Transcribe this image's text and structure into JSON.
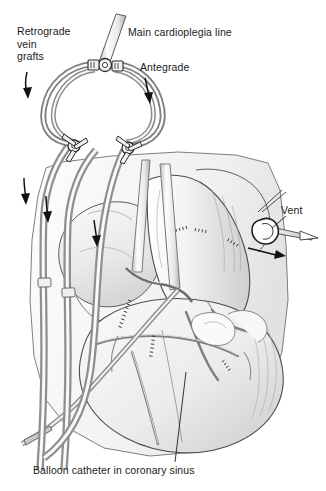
{
  "figure": {
    "labels": {
      "retrograde_vein_grafts": "Retrograde\nvein\ngrafts",
      "main_cardioplegia_line": "Main cardioplegia line",
      "antegrade": "Antegrade",
      "vent": "Vent",
      "balloon_catheter": "Balloon catheter in coronary sinus"
    },
    "colors": {
      "ink": "#1a1a1a",
      "line": "#3c3c3c",
      "tube_stroke": "#8a8a8a",
      "tube_fill": "#f2f2f2",
      "tissue_light": "#f7f7f7",
      "tissue_mid": "#e3e3e3",
      "tissue_dark": "#c9c9c9",
      "background": "#ffffff"
    },
    "flow_arrows": [
      {
        "name": "retrograde-flow-arrow",
        "direction": "down"
      },
      {
        "name": "antegrade-flow-arrow",
        "direction": "down"
      },
      {
        "name": "left-tube-flow-arrow",
        "direction": "down"
      },
      {
        "name": "mid-tube-flow-arrow",
        "direction": "down"
      },
      {
        "name": "right-tube-flow-arrow",
        "direction": "down"
      },
      {
        "name": "vent-flow-arrow",
        "direction": "right"
      }
    ],
    "components": [
      "main-cardioplegia-line",
      "y-connector-top",
      "antegrade-limb",
      "retrograde-limb",
      "stopcock-left",
      "stopcock-right",
      "aortic-root-cannula",
      "vent-cannula",
      "coronary-sinus-balloon-catheter",
      "vein-graft-cannulas",
      "heart-anatomy"
    ]
  }
}
